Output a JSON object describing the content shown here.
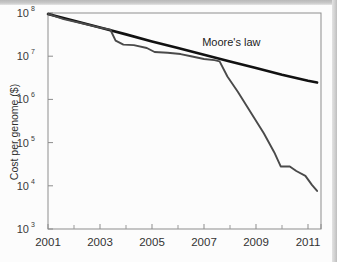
{
  "figure": {
    "background_color": "#fcfcfc",
    "frame_color": "#8d8d8d"
  },
  "chart_data": {
    "type": "line",
    "title": "",
    "subtitle": "",
    "xlabel": "",
    "ylabel": "Cost per genome ($)",
    "xlim": [
      2001,
      2011.5
    ],
    "ylim": [
      1000,
      100000000
    ],
    "yscale": "log",
    "xscale": "linear",
    "grid": false,
    "legend": "none",
    "xticks": [
      2001,
      2003,
      2005,
      2007,
      2009,
      2011
    ],
    "xtick_labels": [
      "2001",
      "2003",
      "2005",
      "2007",
      "2009",
      "2011"
    ],
    "xticks_minor": [
      2002,
      2004,
      2006,
      2008,
      2010
    ],
    "yticks": [
      1000,
      10000,
      100000,
      1000000,
      10000000,
      100000000
    ],
    "ytick_labels": [
      "10³",
      "10⁴",
      "10⁵",
      "10⁶",
      "10⁷",
      "10⁸"
    ],
    "ytick_mantissa": "10",
    "ytick_exponents": [
      "3",
      "4",
      "5",
      "6",
      "7",
      "8"
    ],
    "annotations": [
      {
        "text": "Moore's law",
        "x": 2008.05,
        "y": 17000000,
        "color": "#1d1d1d"
      }
    ],
    "series": [
      {
        "name": "Moore's law",
        "color": "#111111",
        "width": 2.6,
        "points": [
          [
            2001.0,
            95000000
          ],
          [
            2002.0,
            66000000
          ],
          [
            2003.0,
            46000000
          ],
          [
            2004.0,
            32000000
          ],
          [
            2005.0,
            22000000
          ],
          [
            2006.0,
            15500000
          ],
          [
            2007.0,
            10800000
          ],
          [
            2008.0,
            7500000
          ],
          [
            2009.0,
            5300000
          ],
          [
            2010.0,
            3700000
          ],
          [
            2011.0,
            2700000
          ],
          [
            2011.35,
            2450000
          ]
        ]
      },
      {
        "name": "Cost per genome",
        "color": "#4a4a4a",
        "width": 1.9,
        "points": [
          [
            2001.0,
            95000000
          ],
          [
            2001.6,
            72000000
          ],
          [
            2002.3,
            58000000
          ],
          [
            2003.0,
            46000000
          ],
          [
            2003.4,
            41000000
          ],
          [
            2003.6,
            23000000
          ],
          [
            2003.9,
            18500000
          ],
          [
            2004.3,
            18000000
          ],
          [
            2004.8,
            15500000
          ],
          [
            2005.1,
            12500000
          ],
          [
            2005.6,
            12000000
          ],
          [
            2006.1,
            11200000
          ],
          [
            2006.5,
            10000000
          ],
          [
            2007.0,
            8600000
          ],
          [
            2007.4,
            8100000
          ],
          [
            2007.6,
            7600000
          ],
          [
            2007.9,
            3400000
          ],
          [
            2008.3,
            1500000
          ],
          [
            2008.8,
            500000
          ],
          [
            2009.3,
            165000
          ],
          [
            2009.7,
            60000
          ],
          [
            2009.95,
            28000
          ],
          [
            2010.3,
            28000
          ],
          [
            2010.55,
            22000
          ],
          [
            2010.9,
            17000
          ],
          [
            2011.15,
            10500
          ],
          [
            2011.35,
            7600
          ]
        ]
      }
    ]
  }
}
